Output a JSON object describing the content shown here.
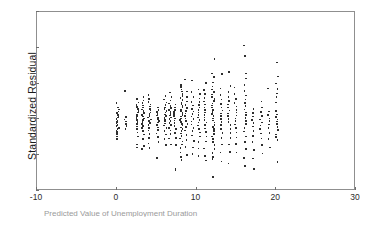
{
  "figure": {
    "background_color": "#ffffff",
    "frame_color": "#8f8f8f",
    "point_color": "#2e2e2e"
  },
  "caption": {
    "text": "Predicted Value of Unemployment Duration"
  },
  "chart_data": {
    "type": "scatter",
    "title": "",
    "xlabel": "",
    "ylabel": "Standardized Residual",
    "xlim": [
      -10,
      30
    ],
    "ylim": [
      -4,
      6
    ],
    "xticks": [
      -10,
      0,
      10,
      20,
      30
    ],
    "yticks": [
      -4,
      -2,
      0,
      2,
      4,
      6
    ],
    "xtick_labels": [
      "-10",
      "0",
      "10",
      "20",
      "30"
    ],
    "ytick_labels": [
      "-4",
      "-2",
      "0",
      "2",
      "4",
      "6"
    ],
    "grid": false,
    "legend": false,
    "series": [
      {
        "name": "residuals",
        "columns": [
          {
            "x": 0.0,
            "y": [
              0.95,
              0.72,
              0.6,
              0.48,
              0.4,
              0.3,
              0.22,
              0.14,
              0.06,
              -0.02,
              -0.1,
              -0.18,
              -0.26,
              -0.34,
              -0.42,
              -0.5,
              -0.58,
              -0.66,
              -0.78,
              -0.92,
              -1.05
            ]
          },
          {
            "x": 1.0,
            "y": [
              1.62,
              0.18,
              0.05,
              -0.08,
              -0.2,
              -0.33,
              -0.48
            ]
          },
          {
            "x": 2.5,
            "y": [
              1.18,
              1.0,
              0.86,
              0.74,
              0.62,
              0.52,
              0.42,
              0.32,
              0.22,
              0.12,
              0.02,
              -0.1,
              -0.22,
              -0.35,
              -0.5,
              -0.68,
              -0.9,
              -1.35,
              -1.52
            ]
          },
          {
            "x": 3.2,
            "y": [
              1.3,
              1.1,
              0.95,
              0.82,
              0.7,
              0.6,
              0.5,
              0.4,
              0.3,
              0.2,
              0.1,
              0.0,
              -0.1,
              -0.2,
              -0.32,
              -0.45,
              -0.6,
              -0.8,
              -1.05,
              -1.45,
              -1.6
            ]
          },
          {
            "x": 4.0,
            "y": [
              1.42,
              1.2,
              1.02,
              0.88,
              0.76,
              0.64,
              0.54,
              0.44,
              0.34,
              0.24,
              0.14,
              0.04,
              -0.06,
              -0.16,
              -0.28,
              -0.42,
              -0.58,
              -0.76,
              -0.98,
              -1.3,
              -1.55
            ]
          },
          {
            "x": 5.0,
            "y": [
              0.72,
              0.58,
              0.46,
              0.36,
              0.26,
              0.16,
              0.06,
              -0.04,
              -0.14,
              -0.26,
              -0.4,
              -0.56,
              -0.74,
              -0.95,
              -1.22,
              -2.1
            ]
          },
          {
            "x": 6.0,
            "y": [
              1.35,
              1.15,
              0.98,
              0.84,
              0.72,
              0.62,
              0.52,
              0.42,
              0.32,
              0.22,
              0.12,
              0.02,
              -0.08,
              -0.18,
              -0.3,
              -0.44,
              -0.6,
              -0.8,
              -1.05,
              -1.4
            ]
          },
          {
            "x": 6.6,
            "y": [
              1.55,
              1.3,
              1.1,
              0.94,
              0.8,
              0.68,
              0.56,
              0.46,
              0.36,
              0.26,
              0.16,
              0.06,
              -0.04,
              -0.16,
              -0.28,
              -0.42,
              -0.58,
              -0.78,
              -1.02,
              -1.35
            ]
          },
          {
            "x": 7.2,
            "y": [
              0.88,
              0.72,
              0.58,
              0.46,
              0.34,
              0.22,
              0.1,
              -0.02,
              -0.16,
              -0.32,
              -0.5,
              -0.72,
              -1.0,
              -1.38,
              -2.7,
              -2.78
            ]
          },
          {
            "x": 8.0,
            "y": [
              1.95,
              1.85,
              1.72,
              1.6,
              1.48,
              1.36,
              1.24,
              1.12,
              1.0,
              0.9,
              0.8,
              0.7,
              0.6,
              0.5,
              0.4,
              0.3,
              0.2,
              0.1,
              0.0,
              -0.1,
              -0.2,
              -0.3,
              -0.4,
              -0.5,
              -0.62,
              -0.74,
              -0.88,
              -1.02,
              -1.18,
              -1.36,
              -1.56,
              -1.8,
              -2.05,
              -2.22
            ]
          },
          {
            "x": 8.6,
            "y": [
              2.28,
              1.6,
              1.3,
              1.05,
              0.85,
              0.68,
              0.52,
              0.38,
              0.24,
              0.1,
              -0.04,
              -0.2,
              -0.38,
              -0.58,
              -0.82,
              -1.12,
              -1.5,
              -1.95
            ]
          },
          {
            "x": 9.4,
            "y": [
              2.22,
              1.58,
              1.28,
              1.02,
              0.82,
              0.64,
              0.48,
              0.34,
              0.2,
              0.06,
              -0.08,
              -0.24,
              -0.42,
              -0.62,
              -0.86,
              -1.16,
              -1.52,
              -1.88
            ]
          },
          {
            "x": 10.2,
            "y": [
              1.72,
              1.45,
              1.22,
              1.02,
              0.85,
              0.7,
              0.56,
              0.42,
              0.28,
              0.14,
              0.0,
              -0.14,
              -0.3,
              -0.48,
              -0.68,
              -0.92,
              -1.22,
              -1.58,
              -2.0
            ]
          },
          {
            "x": 11.0,
            "y": [
              2.08,
              1.7,
              1.45,
              1.24,
              1.05,
              0.88,
              0.72,
              0.58,
              0.44,
              0.3,
              0.16,
              0.02,
              -0.12,
              -0.28,
              -0.46,
              -0.66,
              -0.9,
              -1.2,
              -1.58,
              -2.0,
              -2.25
            ]
          },
          {
            "x": 12.0,
            "y": [
              3.42,
              2.62,
              2.4,
              2.1,
              1.88,
              1.72,
              1.58,
              1.44,
              1.3,
              1.18,
              1.06,
              0.94,
              0.82,
              0.7,
              0.58,
              0.46,
              0.34,
              0.22,
              0.1,
              -0.02,
              -0.14,
              -0.26,
              -0.38,
              -0.5,
              -0.62,
              -0.76,
              -0.9,
              -1.05,
              -1.22,
              -1.4,
              -1.6,
              -1.82,
              -2.05,
              -2.18,
              -3.18
            ]
          },
          {
            "x": 13.0,
            "y": [
              2.58,
              1.78,
              1.42,
              1.15,
              0.92,
              0.72,
              0.54,
              0.38,
              0.22,
              0.06,
              -0.1,
              -0.28,
              -0.48,
              -0.72,
              -1.0,
              -1.35,
              -1.8,
              -2.3
            ]
          },
          {
            "x": 14.0,
            "y": [
              2.7,
              1.92,
              1.58,
              1.3,
              1.08,
              0.88,
              0.7,
              0.54,
              0.38,
              0.22,
              0.06,
              -0.1,
              -0.28,
              -0.48,
              -0.72,
              -1.0,
              -1.35,
              -1.78,
              -2.42
            ]
          },
          {
            "x": 14.8,
            "y": [
              1.82,
              1.48,
              1.2,
              0.96,
              0.76,
              0.58,
              0.42,
              0.26,
              0.1,
              -0.06,
              -0.24,
              -0.44,
              -0.68,
              -0.96,
              -1.32,
              -1.8
            ]
          },
          {
            "x": 16.0,
            "y": [
              4.18,
              3.58,
              2.62,
              2.32,
              1.95,
              1.62,
              1.38,
              1.16,
              0.96,
              0.78,
              0.6,
              0.44,
              0.28,
              0.12,
              -0.04,
              -0.22,
              -0.42,
              -0.64,
              -0.9,
              -1.22,
              -1.62,
              -2.12,
              -2.55
            ]
          },
          {
            "x": 17.0,
            "y": [
              0.62,
              0.4,
              0.2,
              0.02,
              -0.16,
              -0.36,
              -0.6,
              -0.88,
              -1.22,
              -1.65,
              -2.15,
              -2.72
            ]
          },
          {
            "x": 18.0,
            "y": [
              1.05,
              0.72,
              0.45,
              0.22,
              0.05,
              -0.12,
              -0.3,
              -0.5,
              -0.74,
              -1.02,
              -1.38,
              -1.85
            ]
          },
          {
            "x": 19.0,
            "y": [
              1.78,
              0.48,
              0.28,
              0.1,
              -0.06,
              -0.24,
              -0.44,
              -0.7,
              -1.05,
              -1.52
            ]
          },
          {
            "x": 20.0,
            "y": [
              3.22,
              2.45,
              2.05,
              1.75,
              1.5,
              1.28,
              0.98,
              0.52,
              0.32,
              0.18,
              0.05,
              -0.08,
              -0.22,
              -0.38,
              -0.56,
              -0.8,
              -0.95,
              -1.12,
              -2.32
            ]
          }
        ]
      }
    ]
  }
}
